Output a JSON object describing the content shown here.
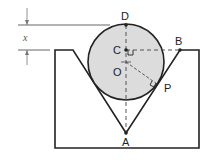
{
  "diagram": {
    "type": "geometry",
    "colors": {
      "stroke": "#222222",
      "circle_fill": "#dcdcdc",
      "dim_line": "#666666",
      "background": "#ffffff"
    },
    "labels": {
      "D": "D",
      "C": "C",
      "O": "O",
      "B": "B",
      "P": "P",
      "A": "A",
      "x": "x"
    },
    "points": {
      "D": {
        "x": 126,
        "y": 25
      },
      "C": {
        "x": 126,
        "y": 50
      },
      "O": {
        "x": 126,
        "y": 62
      },
      "B": {
        "x": 180,
        "y": 50
      },
      "P": {
        "x": 157,
        "y": 84
      },
      "A": {
        "x": 126,
        "y": 133
      }
    },
    "circle": {
      "cx": 126,
      "cy": 62,
      "r": 38
    },
    "block": {
      "left": 55,
      "top": 50,
      "right": 199,
      "bottom": 148
    },
    "groove": {
      "left_top": {
        "x": 73,
        "y": 50
      },
      "bottom": {
        "x": 126,
        "y": 133
      },
      "right_top": {
        "x": 180,
        "y": 50
      }
    },
    "dimension": {
      "label": "x",
      "from_y": 25,
      "to_y": 50
    }
  }
}
